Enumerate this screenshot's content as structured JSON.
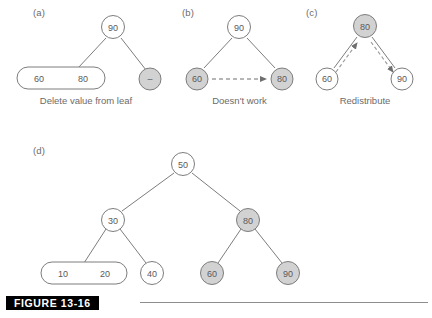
{
  "figure": {
    "caption_label": "FIGURE 13-16",
    "colors": {
      "node_fill_white": "#ffffff",
      "node_fill_shaded": "#d2d2d2",
      "node_stroke": "#7d7d7d",
      "edge_stroke": "#7d7d7d",
      "text": "#5a5a5a",
      "caption_bar_bg": "#000000",
      "caption_bar_text": "#ffffff"
    }
  },
  "panels": [
    {
      "label": "(a)",
      "caption": "Delete value from leaf",
      "nodes": {
        "root": "90",
        "leaf_pair_left": "60",
        "leaf_pair_right": "80",
        "empty_node": "–"
      }
    },
    {
      "label": "(b)",
      "caption": "Doesn't work",
      "nodes": {
        "root": "90",
        "left": "60",
        "right": "80"
      }
    },
    {
      "label": "(c)",
      "caption": "Redistribute",
      "nodes": {
        "root": "80",
        "left": "60",
        "right": "90"
      }
    },
    {
      "label": "(d)",
      "caption": "",
      "nodes": {
        "root": "50",
        "left_child": "30",
        "right_child": "80",
        "leaf_a_left": "10",
        "leaf_a_right": "20",
        "leaf_b": "40",
        "leaf_c": "60",
        "leaf_d": "90"
      }
    }
  ]
}
